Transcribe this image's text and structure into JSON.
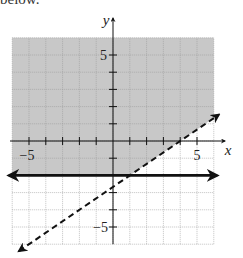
{
  "header_text": "below.",
  "chart_data": {
    "type": "line",
    "title": "",
    "xlabel": "x",
    "ylabel": "y",
    "xlim": [
      -6,
      6
    ],
    "ylim": [
      -6,
      6
    ],
    "grid": true,
    "tick_labels": {
      "x": [
        "-5",
        "5"
      ],
      "y": [
        "5",
        "-5"
      ]
    },
    "series": [
      {
        "name": "solid boundary",
        "style": "solid",
        "equation": "y = -2",
        "points": [
          [
            -6.2,
            -2
          ],
          [
            6.2,
            -2
          ]
        ]
      },
      {
        "name": "dashed boundary",
        "style": "dashed",
        "equation": "y = (2/3)x - 8/3",
        "points": [
          [
            -5.6,
            -6.4
          ],
          [
            6.3,
            1.53
          ]
        ]
      }
    ],
    "shaded_region": "y > (2/3)x - 8/3 and y >= -2",
    "shade_color": "#c8c8c8"
  }
}
